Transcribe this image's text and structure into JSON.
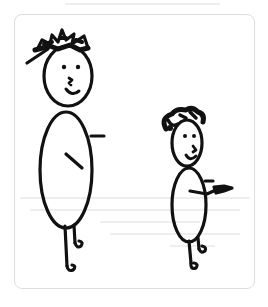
{
  "illustration": {
    "description": "Hand-drawn stick figures: a tall adult and a short child",
    "figures": [
      {
        "name": "tall-figure",
        "hair": "spiky",
        "expression": "smile"
      },
      {
        "name": "short-figure",
        "hair": "curly",
        "expression": "smile"
      }
    ],
    "colors": {
      "ink": "#111111",
      "card_border": "#dedede",
      "background": "#ffffff",
      "bleed_through": "#ececec"
    }
  }
}
